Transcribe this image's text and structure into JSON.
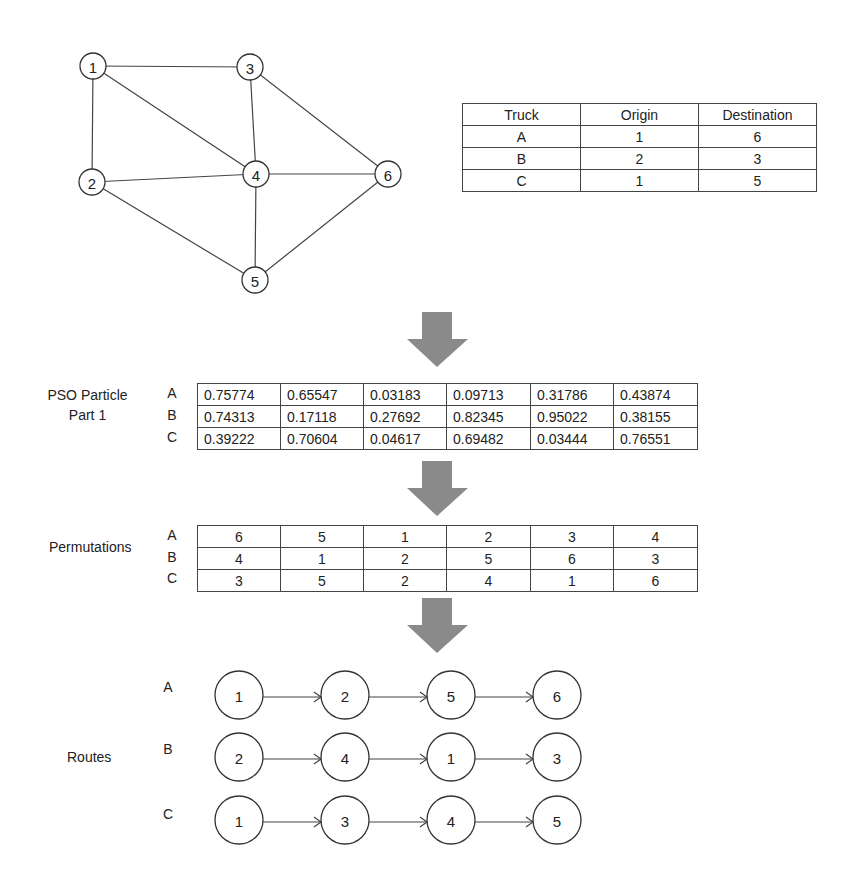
{
  "graph": {
    "nodes": [
      {
        "id": "1",
        "x": 93,
        "y": 66
      },
      {
        "id": "2",
        "x": 92,
        "y": 182
      },
      {
        "id": "3",
        "x": 250,
        "y": 67
      },
      {
        "id": "4",
        "x": 256,
        "y": 174
      },
      {
        "id": "5",
        "x": 255,
        "y": 280
      },
      {
        "id": "6",
        "x": 388,
        "y": 174
      }
    ],
    "edges": [
      [
        "1",
        "3"
      ],
      [
        "1",
        "2"
      ],
      [
        "1",
        "4"
      ],
      [
        "3",
        "4"
      ],
      [
        "3",
        "6"
      ],
      [
        "2",
        "4"
      ],
      [
        "4",
        "6"
      ],
      [
        "2",
        "5"
      ],
      [
        "4",
        "5"
      ],
      [
        "5",
        "6"
      ]
    ]
  },
  "truck_table": {
    "headers": [
      "Truck",
      "Origin",
      "Destination"
    ],
    "rows": [
      [
        "A",
        "1",
        "6"
      ],
      [
        "B",
        "2",
        "3"
      ],
      [
        "C",
        "1",
        "5"
      ]
    ]
  },
  "pso": {
    "label_line1": "PSO Particle",
    "label_line2": "Part 1",
    "row_labels": [
      "A",
      "B",
      "C"
    ],
    "rows": [
      [
        "0.75774",
        "0.65547",
        "0.03183",
        "0.09713",
        "0.31786",
        "0.43874"
      ],
      [
        "0.74313",
        "0.17118",
        "0.27692",
        "0.82345",
        "0.95022",
        "0.38155"
      ],
      [
        "0.39222",
        "0.70604",
        "0.04617",
        "0.69482",
        "0.03444",
        "0.76551"
      ]
    ]
  },
  "permutations": {
    "label": "Permutations",
    "row_labels": [
      "A",
      "B",
      "C"
    ],
    "rows": [
      [
        "6",
        "5",
        "1",
        "2",
        "3",
        "4"
      ],
      [
        "4",
        "1",
        "2",
        "5",
        "6",
        "3"
      ],
      [
        "3",
        "5",
        "2",
        "4",
        "1",
        "6"
      ]
    ]
  },
  "routes": {
    "label": "Routes",
    "rows": [
      {
        "truck": "A",
        "nodes": [
          "1",
          "2",
          "5",
          "6"
        ]
      },
      {
        "truck": "B",
        "nodes": [
          "2",
          "4",
          "1",
          "3"
        ]
      },
      {
        "truck": "C",
        "nodes": [
          "1",
          "3",
          "4",
          "5"
        ]
      }
    ]
  },
  "colors": {
    "arrow": "#8a8a8a",
    "line": "#444444"
  }
}
